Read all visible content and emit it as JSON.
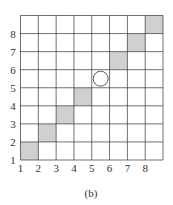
{
  "figure": {
    "caption": "(b)",
    "grid_size": 8,
    "x_tick_labels": [
      "1",
      "2",
      "3",
      "4",
      "5",
      "6",
      "7",
      "8"
    ],
    "y_tick_labels": [
      "1",
      "2",
      "3",
      "4",
      "5",
      "6",
      "7",
      "8"
    ],
    "shaded_cells": [
      [
        1,
        1
      ],
      [
        2,
        2
      ],
      [
        3,
        3
      ],
      [
        4,
        4
      ],
      [
        6,
        6
      ],
      [
        7,
        7
      ],
      [
        8,
        8
      ]
    ],
    "circle_cell": [
      5,
      5
    ],
    "colors": {
      "shade": "#d0d0d0",
      "line": "#333333",
      "background": "#ffffff"
    }
  }
}
